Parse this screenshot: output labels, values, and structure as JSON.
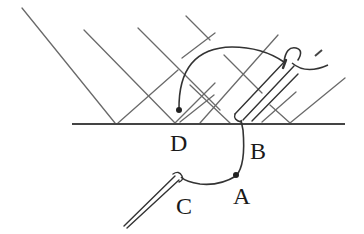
{
  "diagram": {
    "type": "physics-mirror-reflection-sketch",
    "labels": {
      "D": "D",
      "B": "B",
      "A": "A",
      "C": "C"
    },
    "colors": {
      "stroke": "#555555",
      "dark_stroke": "#222222",
      "background": "#ffffff"
    },
    "elements": [
      "surface line (horizontal)",
      "incident/reflected diagonal rays forming V shapes at the surface",
      "curved wire from point D looping over to top of upper needle",
      "upper needle/tube resting at point B",
      "curved wire from B through A to lower needle at C",
      "lower needle C"
    ]
  }
}
